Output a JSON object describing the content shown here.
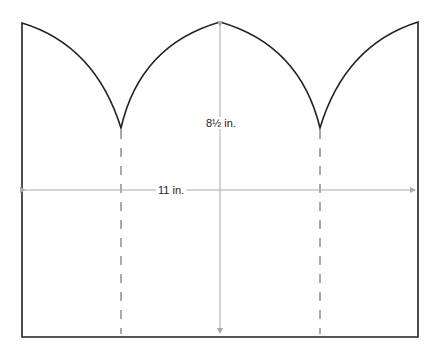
{
  "diagram": {
    "type": "template-cutout",
    "shape": "rectangle with three pointed arch tops",
    "colors": {
      "outline": "#222222",
      "fold_line": "#555555",
      "dimension_line": "#aaaaaa",
      "text": "#222222",
      "background": "#ffffff"
    },
    "dimensions": {
      "height_label": "8½ in.",
      "width_label": "11 in."
    },
    "fold_lines": [
      {
        "position": "left-valley",
        "style": "dashed"
      },
      {
        "position": "right-valley",
        "style": "dashed"
      }
    ]
  }
}
